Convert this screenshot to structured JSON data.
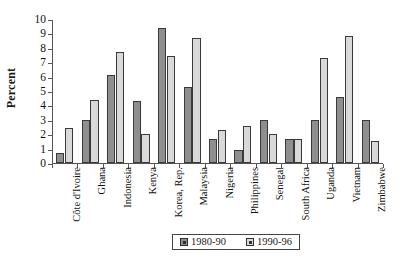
{
  "chart_data": {
    "type": "bar",
    "title": "",
    "xlabel": "",
    "ylabel": "Percent",
    "ylim": [
      0,
      10
    ],
    "ytick_labels": [
      "10",
      "9",
      "8",
      "7",
      "6",
      "5",
      "4",
      "3",
      "2",
      "1",
      "0"
    ],
    "grid": false,
    "legend_position": "bottom-center",
    "categories": [
      "Côte d'Ivoire",
      "Ghana",
      "Indonesia",
      "Kenya",
      "Korea, Rep.",
      "Malaysia",
      "Nigeria",
      "Philippines",
      "Senegal",
      "South Africa",
      "Uganda",
      "Vietnam",
      "Zimbabwe"
    ],
    "series": [
      {
        "name": "1980-90",
        "color": "#8f8f8f",
        "values": [
          0.7,
          3.0,
          6.1,
          4.3,
          9.4,
          5.3,
          1.7,
          0.9,
          3.0,
          1.7,
          3.0,
          4.6,
          3.0
        ]
      },
      {
        "name": "1990-96",
        "color": "#d9d9d9",
        "values": [
          2.4,
          4.4,
          7.7,
          2.0,
          7.4,
          8.7,
          2.3,
          2.6,
          2.0,
          1.7,
          7.3,
          8.8,
          1.5
        ]
      }
    ]
  },
  "legend": {
    "items": [
      {
        "label": "1980-90"
      },
      {
        "label": "1990-96"
      }
    ]
  }
}
